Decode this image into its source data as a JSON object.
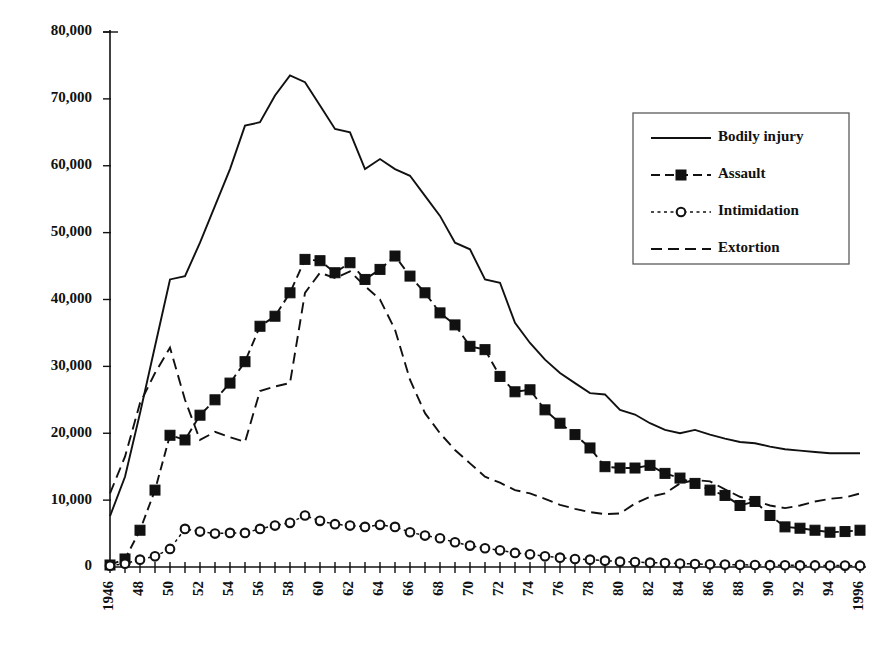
{
  "chart_data": {
    "type": "line",
    "title": "",
    "subtitle": "",
    "xlabel": "",
    "ylabel": "",
    "xlim": [
      1946,
      1996
    ],
    "ylim": [
      0,
      80000
    ],
    "grid": false,
    "legend_position": "upper-right",
    "y_ticks": [
      0,
      10000,
      20000,
      30000,
      40000,
      50000,
      60000,
      70000,
      80000
    ],
    "y_tick_labels": [
      "0",
      "10,000",
      "20,000",
      "30,000",
      "40,000",
      "50,000",
      "60,000",
      "70,000",
      "80,000"
    ],
    "x_tick_labels": [
      "1946",
      "48",
      "50",
      "52",
      "54",
      "56",
      "58",
      "60",
      "62",
      "64",
      "66",
      "68",
      "70",
      "72",
      "74",
      "76",
      "78",
      "80",
      "82",
      "84",
      "86",
      "88",
      "90",
      "92",
      "94",
      "1996"
    ],
    "x_tick_label_rotation": -90,
    "x_tick_label_step_years": 2,
    "x": [
      1946,
      1947,
      1948,
      1949,
      1950,
      1951,
      1952,
      1953,
      1954,
      1955,
      1956,
      1957,
      1958,
      1959,
      1960,
      1961,
      1962,
      1963,
      1964,
      1965,
      1966,
      1967,
      1968,
      1969,
      1970,
      1971,
      1972,
      1973,
      1974,
      1975,
      1976,
      1977,
      1978,
      1979,
      1980,
      1981,
      1982,
      1983,
      1984,
      1985,
      1986,
      1987,
      1988,
      1989,
      1990,
      1991,
      1992,
      1993,
      1994,
      1995,
      1996
    ],
    "series": [
      {
        "name": "Bodily injury",
        "style": "solid",
        "marker": "none",
        "color": "#111111",
        "values": [
          7600,
          13500,
          23000,
          33000,
          43000,
          43500,
          48500,
          54000,
          59500,
          66000,
          66500,
          70500,
          73500,
          72500,
          69000,
          65500,
          65000,
          59500,
          61000,
          59500,
          58500,
          55500,
          52500,
          48500,
          47500,
          43000,
          42500,
          36500,
          33500,
          31000,
          29000,
          27500,
          26000,
          25800,
          23500,
          22800,
          21500,
          20500,
          20000,
          20500,
          19800,
          19200,
          18700,
          18500,
          18000,
          17600,
          17400,
          17200,
          17000,
          17000,
          17000
        ]
      },
      {
        "name": "Assault",
        "style": "dashed",
        "marker": "square",
        "color": "#111111",
        "values": [
          300,
          1200,
          5500,
          11500,
          19700,
          19000,
          22700,
          25000,
          27500,
          30700,
          36000,
          37500,
          41000,
          46000,
          45800,
          44000,
          45500,
          43000,
          44500,
          46500,
          43500,
          41000,
          38000,
          36200,
          33000,
          32500,
          28500,
          26200,
          26500,
          23500,
          21500,
          19800,
          17800,
          15000,
          14800,
          14800,
          15200,
          14000,
          13300,
          12500,
          11500,
          10700,
          9200,
          9800,
          7700,
          6000,
          5800,
          5500,
          5200,
          5300,
          5500
        ]
      },
      {
        "name": "Intimidation",
        "style": "dotted",
        "marker": "circle",
        "color": "#111111",
        "values": [
          200,
          500,
          1100,
          1600,
          2700,
          5700,
          5300,
          5000,
          5100,
          5100,
          5700,
          6200,
          6600,
          7700,
          6900,
          6400,
          6200,
          6000,
          6300,
          6000,
          5200,
          4700,
          4300,
          3700,
          3200,
          2800,
          2500,
          2100,
          1900,
          1600,
          1400,
          1200,
          1100,
          950,
          800,
          750,
          650,
          600,
          520,
          450,
          400,
          370,
          330,
          300,
          280,
          260,
          240,
          230,
          220,
          210,
          200
        ]
      },
      {
        "name": "Extortion",
        "style": "dashed-long",
        "marker": "none",
        "color": "#111111",
        "values": [
          11000,
          16500,
          24500,
          29000,
          32800,
          25000,
          19000,
          20200,
          19400,
          18700,
          26300,
          27000,
          27500,
          41000,
          44000,
          43200,
          44200,
          42000,
          40000,
          35500,
          28000,
          23000,
          20000,
          17500,
          15500,
          13500,
          12600,
          11500,
          11000,
          10200,
          9300,
          8700,
          8200,
          7900,
          8000,
          9500,
          10500,
          11000,
          12500,
          13000,
          12800,
          11600,
          10500,
          9900,
          9200,
          8800,
          9200,
          9800,
          10200,
          10400,
          11000
        ]
      }
    ]
  },
  "legend": {
    "items": [
      {
        "label": "Bodily injury",
        "style": "solid",
        "marker": "none"
      },
      {
        "label": "Assault",
        "style": "dashed",
        "marker": "square"
      },
      {
        "label": "Intimidation",
        "style": "dotted",
        "marker": "circle"
      },
      {
        "label": "Extortion",
        "style": "dashed-long",
        "marker": "none"
      }
    ]
  }
}
